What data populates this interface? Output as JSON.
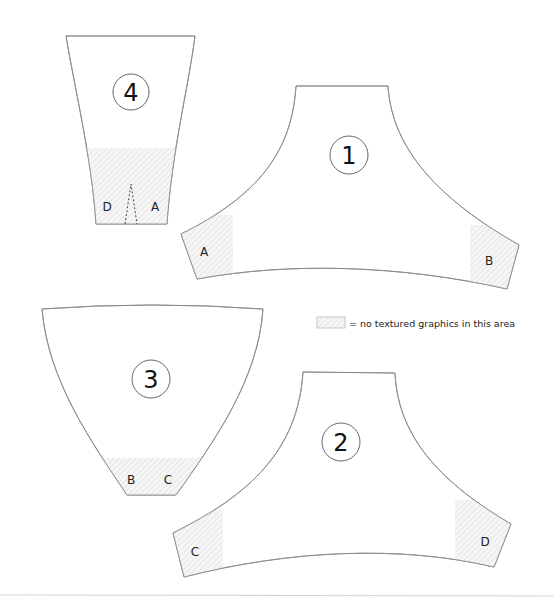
{
  "diagram": {
    "type": "sewing-pattern-pieces",
    "pieces": [
      {
        "id": "piece-1",
        "number": "1",
        "labels": [
          "A",
          "B"
        ]
      },
      {
        "id": "piece-2",
        "number": "2",
        "labels": [
          "C",
          "D"
        ]
      },
      {
        "id": "piece-3",
        "number": "3",
        "labels": [
          "B",
          "C"
        ]
      },
      {
        "id": "piece-4",
        "number": "4",
        "labels": [
          "D",
          "A"
        ]
      }
    ],
    "legend": {
      "swatch": "hatched-area",
      "text": "= no textured graphics in this area"
    },
    "colors": {
      "outline": "#8a8a8a",
      "hatch": "#d9d9d9",
      "text": "#222222"
    }
  }
}
